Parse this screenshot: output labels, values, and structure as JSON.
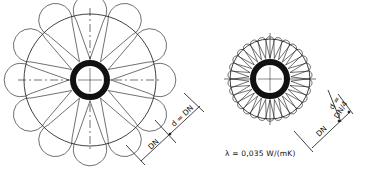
{
  "figure": {
    "background": "#ffffff",
    "line_color": "#111111",
    "left_bundle": {
      "center": [
        90,
        80
      ],
      "outer_radius": 66,
      "pipe_outer_radius": 20,
      "pipe_inner_radius": 14,
      "petal_count": 12,
      "dimension": {
        "label_dn": "DN",
        "label_d": "d = DN"
      }
    },
    "right_bundle": {
      "center": [
        270,
        79
      ],
      "outer_radius": 40,
      "pipe_outer_radius": 20,
      "pipe_inner_radius": 14,
      "petal_count": 30,
      "dimension": {
        "label_dn": "DN",
        "label_d_line1": "d =",
        "label_d_line2": "DN/4"
      }
    },
    "formula": "λ = 0,035 W/(mK)"
  }
}
